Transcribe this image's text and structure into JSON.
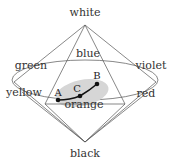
{
  "diagram": {
    "vertices": {
      "white": "white",
      "black": "black",
      "blue": "blue",
      "green": "green",
      "violet": "violet",
      "yellow": "yellow",
      "red": "red",
      "orange": "orange"
    },
    "points": {
      "A": "A",
      "B": "B",
      "C": "C"
    },
    "colors": {
      "lines": "#555555",
      "shaded_region": "#d6d6d6",
      "path": "#111111",
      "text": "#333333"
    }
  }
}
